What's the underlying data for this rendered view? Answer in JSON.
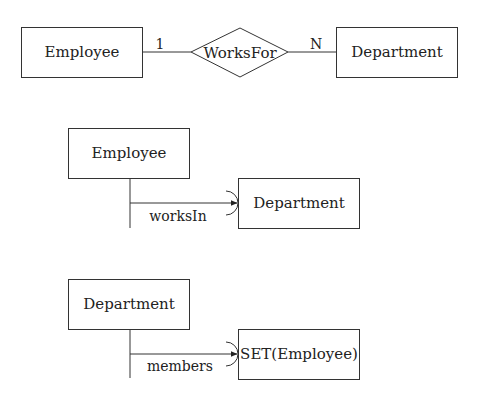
{
  "er_diagram": {
    "left_entity": "Employee",
    "relationship": "WorksFor",
    "right_entity": "Department",
    "left_cardinality": "1",
    "right_cardinality": "N"
  },
  "reference_diagram_1": {
    "source_entity": "Employee",
    "attribute_label": "worksIn",
    "target_entity": "Department"
  },
  "reference_diagram_2": {
    "source_entity": "Department",
    "attribute_label": "members",
    "target_entity": "SET(Employee)"
  },
  "colors": {
    "stroke": "#333333",
    "text": "#222222",
    "background": "#ffffff"
  }
}
